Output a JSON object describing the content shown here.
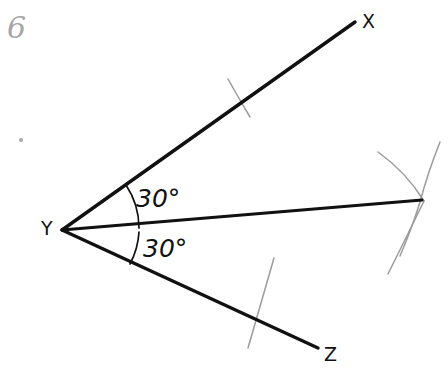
{
  "problem": {
    "number": "6"
  },
  "figure": {
    "vertex_label": "Y",
    "ray_end_labels": {
      "upper": "X",
      "lower": "Z"
    },
    "angle_labels": {
      "upper": "30°",
      "lower": "30°"
    },
    "colors": {
      "ink": "#111111",
      "pencil_construction": "#9b9b9b",
      "problem_number": "#a6a6a6",
      "background": "#ffffff"
    },
    "geometry": {
      "vertex": {
        "x": 62,
        "y": 230
      },
      "ray_yx_end": {
        "x": 355,
        "y": 22
      },
      "ray_yz_end": {
        "x": 318,
        "y": 348
      },
      "bisector_end": {
        "x": 422,
        "y": 200
      },
      "angle_arc_radius_upper": 78,
      "angle_arc_radius_lower": 78,
      "upper_angle_degrees": 30,
      "lower_angle_degrees": 30,
      "total_angle_degrees": 60
    },
    "construction_marks": [
      {
        "name": "tick-on-ray-yx",
        "x": 240,
        "y": 97
      },
      {
        "name": "arc-crossing-ray-yz",
        "x": 258,
        "y": 318
      },
      {
        "name": "arc-intersection-right-upper",
        "x": 422,
        "y": 200
      },
      {
        "name": "arc-intersection-right-lower",
        "x": 422,
        "y": 200
      }
    ],
    "artifact_dot": {
      "x": 21,
      "y": 140
    }
  }
}
